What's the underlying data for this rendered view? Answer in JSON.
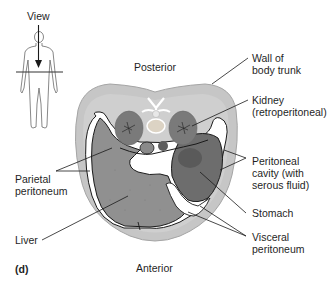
{
  "figure": {
    "panel_letter": "(d)",
    "orientation": {
      "top": "Posterior",
      "bottom": "Anterior"
    },
    "view_indicator": {
      "label": "View"
    },
    "labels_right": [
      {
        "id": "wall",
        "lines": [
          "Wall of",
          "body trunk"
        ]
      },
      {
        "id": "kidney",
        "lines": [
          "Kidney",
          "(retroperitoneal)"
        ]
      },
      {
        "id": "peritoneal_cavity",
        "lines": [
          "Peritoneal",
          "cavity (with",
          "serous fluid)"
        ]
      },
      {
        "id": "stomach",
        "lines": [
          "Stomach"
        ]
      },
      {
        "id": "visceral",
        "lines": [
          "Visceral",
          "peritoneum"
        ]
      }
    ],
    "labels_left": [
      {
        "id": "parietal",
        "lines": [
          "Parietal",
          "peritoneum"
        ]
      },
      {
        "id": "liver",
        "lines": [
          "Liver"
        ]
      }
    ],
    "colors": {
      "body_wall": "#c4c4c4",
      "body_wall_edge": "#a8a8a8",
      "inner_body": "#d2d2d2",
      "liver": "#8f8f8f",
      "stomach": "#6e6e6e",
      "kidney": "#7a7a7a",
      "peritoneal_space": "#ffffff",
      "line": "#1a1a1a"
    }
  }
}
